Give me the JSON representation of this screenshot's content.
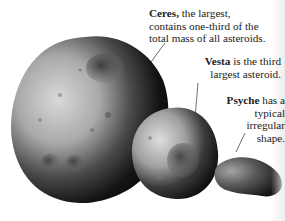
{
  "labels": {
    "ceres": {
      "name": "Ceres,",
      "line1_rest": " the largest,",
      "line2": "contains one-third of the",
      "line3": "total mass of all asteroids."
    },
    "vesta": {
      "name": "Vesta",
      "line1_rest": " is the third",
      "line2": "largest asteroid."
    },
    "psyche": {
      "name": "Psyche",
      "line1_rest": " has a",
      "line2": "typical",
      "line3": "irregular",
      "line4": "shape."
    }
  },
  "objects": [
    "Ceres",
    "Vesta",
    "Psyche"
  ]
}
